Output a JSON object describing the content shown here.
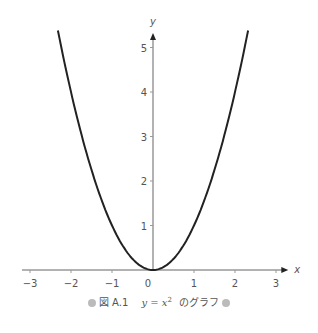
{
  "chart_data": {
    "type": "line",
    "title": "",
    "function": "y = x^2",
    "xlabel": "x",
    "ylabel": "y",
    "xlim": [
      -3.2,
      3.3
    ],
    "ylim": [
      0,
      5.4
    ],
    "x_ticks": [
      -3,
      -2,
      -1,
      0,
      1,
      2,
      3
    ],
    "x_tick_labels": [
      "−3",
      "−2",
      "−1",
      "0",
      "1",
      "2",
      "3"
    ],
    "y_ticks": [
      1,
      2,
      3,
      4,
      5
    ],
    "y_tick_labels": [
      "1",
      "2",
      "3",
      "4",
      "5"
    ],
    "grid": false,
    "legend": "none",
    "series": [
      {
        "name": "y = x^2",
        "x_range": [
          -2.32,
          2.32
        ],
        "x": [
          -2.3,
          -2,
          -1.5,
          -1,
          -0.5,
          0,
          0.5,
          1,
          1.5,
          2,
          2.3
        ],
        "y": [
          5.29,
          4,
          2.25,
          1,
          0.25,
          0,
          0.25,
          1,
          2.25,
          4,
          5.29
        ],
        "color": "#222222"
      }
    ]
  },
  "caption": {
    "prefix": "図 A.1",
    "math_lhs": "y = x",
    "math_exp": "2",
    "suffix": "のグラフ"
  },
  "colors": {
    "curve": "#222222",
    "axis": "#999999",
    "caption_dot": "#bbbbbb"
  }
}
